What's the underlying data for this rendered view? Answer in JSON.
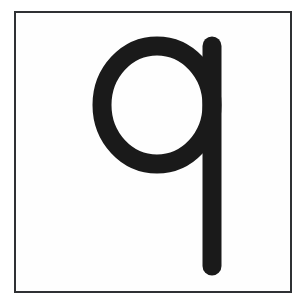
{
  "card": {
    "kind": "letter-flashcard",
    "character": "q",
    "character_case": "lowercase",
    "script": "latin",
    "border_color": "#2f3134",
    "border_width_px": 2,
    "card_background": "#fefefe",
    "page_background": "#ffffff"
  },
  "glyph": {
    "label": "q",
    "color": "#1a1a1a",
    "stroke_width_px": 19,
    "style": "single-storey sans-serif, rounded terminals",
    "bowl": {
      "center_x": 157,
      "center_y": 105,
      "radius_x": 55,
      "radius_y": 59
    },
    "stem": {
      "x": 212,
      "top_y": 46,
      "bottom_y": 266
    },
    "bounds": {
      "left": 92,
      "top": 36,
      "right": 222,
      "bottom": 276
    }
  }
}
